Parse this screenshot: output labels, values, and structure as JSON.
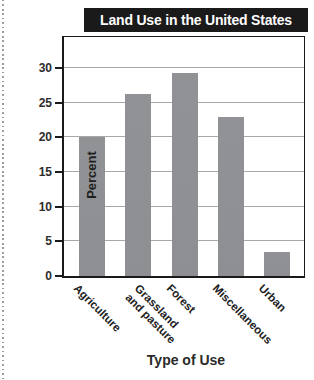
{
  "chart_data": {
    "type": "bar",
    "title": "Land Use in the United States",
    "xlabel": "Type of Use",
    "ylabel": "Percent",
    "categories": [
      "Agriculture",
      "Grassland\nand pasture",
      "Forest",
      "Miscellaneous",
      "Urban"
    ],
    "values": [
      20,
      26.3,
      29.3,
      23,
      3.5
    ],
    "yticks": [
      0,
      5,
      10,
      15,
      20,
      25,
      30
    ],
    "ylim": [
      0,
      34.8
    ],
    "grid": true,
    "legend": false,
    "colors": {
      "bar": "#8f9193",
      "title_bar_bg": "#1a1a1a",
      "title_text": "#ffffff",
      "gridline": "#a8a8a8",
      "axis": "#1a1a1a",
      "tick_label": "#2d2d2d"
    }
  }
}
